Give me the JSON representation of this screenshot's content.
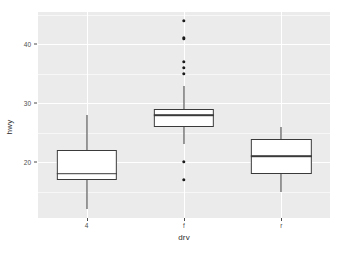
{
  "chart_data": {
    "type": "box",
    "title": "",
    "subtitle": "",
    "xlabel": "drv",
    "ylabel": "hwy",
    "categories": [
      "4",
      "f",
      "r"
    ],
    "ylim": [
      10.5,
      45.5
    ],
    "yticks": [
      20,
      30,
      40
    ],
    "ytick_labels": [
      "20",
      "30",
      "40"
    ],
    "y_minor_ticks": [
      15,
      25,
      35,
      45
    ],
    "grid": true,
    "grid_color": "#ffffff",
    "panel_background": "#ebebeb",
    "legend": "none",
    "box_fill": "#ffffff",
    "box_stroke": "#3a3a3a",
    "outlier_color": "#1a1a1a",
    "boxes": [
      {
        "category": "4",
        "lower_whisker": 12,
        "q1": 17,
        "median": 18,
        "q3": 22,
        "upper_whisker": 28,
        "outliers": []
      },
      {
        "category": "f",
        "lower_whisker": 23,
        "q1": 26,
        "median": 28,
        "q3": 29,
        "upper_whisker": 33,
        "outliers": [
          44,
          41,
          37,
          36,
          35,
          20,
          17
        ]
      },
      {
        "category": "r",
        "lower_whisker": 15,
        "q1": 18,
        "median": 21,
        "q3": 24,
        "upper_whisker": 26,
        "outliers": []
      }
    ]
  }
}
